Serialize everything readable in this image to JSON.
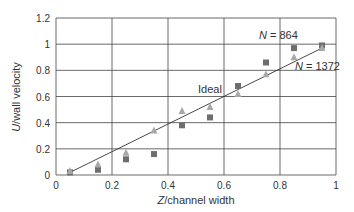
{
  "chart_data": {
    "type": "scatter",
    "title": "",
    "xlabel": "Z/channel width",
    "ylabel": "U/wall velocity",
    "xlim": [
      0,
      1
    ],
    "ylim": [
      0,
      1.2
    ],
    "x_ticks": [
      "0",
      "0.2",
      "0.4",
      "0.6",
      "0.8",
      "1"
    ],
    "y_ticks": [
      "0",
      "0.2",
      "0.4",
      "0.6",
      "0.8",
      "1",
      "1.2"
    ],
    "grid": true,
    "series": [
      {
        "name": "N = 864",
        "marker": "square",
        "color": "#6e6e6e",
        "x": [
          0.05,
          0.15,
          0.25,
          0.35,
          0.45,
          0.55,
          0.65,
          0.75,
          0.85,
          0.95
        ],
        "y": [
          0.02,
          0.04,
          0.12,
          0.16,
          0.38,
          0.44,
          0.68,
          0.86,
          0.97,
          0.99
        ]
      },
      {
        "name": "N = 1372",
        "marker": "triangle",
        "color": "#a8a8a8",
        "x": [
          0.05,
          0.15,
          0.25,
          0.35,
          0.45,
          0.55,
          0.65,
          0.75,
          0.85,
          0.95
        ],
        "y": [
          0.03,
          0.08,
          0.17,
          0.34,
          0.49,
          0.52,
          0.62,
          0.77,
          0.9,
          0.97
        ]
      },
      {
        "name": "Ideal",
        "marker": "line",
        "color": "#333333",
        "x": [
          0.05,
          0.95
        ],
        "y": [
          0.02,
          0.97
        ]
      }
    ],
    "annotations": [
      {
        "text_italic": "N",
        "text": " = 864",
        "x": 0.73,
        "y": 1.05
      },
      {
        "text_italic": "N",
        "text": " = 1372",
        "x": 0.85,
        "y": 0.88
      },
      {
        "text": "Ideal",
        "x": 0.4,
        "y": 0.72
      }
    ]
  },
  "labels": {
    "ylabel_italic": "U",
    "ylabel_rest": "/wall velocity",
    "xlabel_italic": "Z",
    "xlabel_rest": "/channel width",
    "ann1_italic": "N",
    "ann1_rest": " = 864",
    "ann2_italic": "N",
    "ann2_rest": " = 1372",
    "ann3": "Ideal"
  }
}
